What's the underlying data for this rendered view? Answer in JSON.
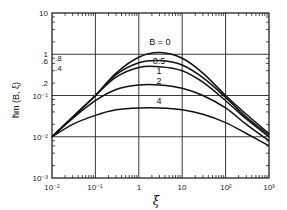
{
  "chart_data": {
    "type": "line",
    "title": "",
    "xlabel": "ξ",
    "ylabel": "h̄m(B,ξ)",
    "xscale": "log",
    "yscale": "log",
    "xlim": [
      0.01,
      1000
    ],
    "ylim": [
      0.001,
      10
    ],
    "grid": true,
    "x_ticks": [
      "10⁻²",
      "10⁻¹",
      "1",
      "10",
      "10²",
      "10³"
    ],
    "y_ticks": [
      "10⁻³",
      "10⁻²",
      "10⁻¹",
      ".2",
      ".4",
      ".6",
      ".8",
      "1",
      "10"
    ],
    "x": [
      0.01,
      0.03,
      0.1,
      0.3,
      1,
      3,
      10,
      30,
      100,
      300,
      1000
    ],
    "series": [
      {
        "name": "B = 0",
        "label": "B = 0",
        "values": [
          0.01,
          0.03,
          0.1,
          0.35,
          0.85,
          1.1,
          0.8,
          0.35,
          0.1,
          0.035,
          0.012
        ]
      },
      {
        "name": "B = 0.5",
        "label": "0.5",
        "values": [
          0.01,
          0.03,
          0.1,
          0.32,
          0.62,
          0.7,
          0.55,
          0.27,
          0.09,
          0.03,
          0.011
        ]
      },
      {
        "name": "B = 1",
        "label": "1",
        "values": [
          0.01,
          0.03,
          0.1,
          0.28,
          0.48,
          0.5,
          0.4,
          0.21,
          0.075,
          0.027,
          0.01
        ]
      },
      {
        "name": "B = 2",
        "label": "2",
        "values": [
          0.01,
          0.028,
          0.075,
          0.14,
          0.18,
          0.18,
          0.15,
          0.1,
          0.05,
          0.02,
          0.008
        ]
      },
      {
        "name": "B = 4",
        "label": "4",
        "values": [
          0.01,
          0.02,
          0.033,
          0.045,
          0.05,
          0.05,
          0.045,
          0.035,
          0.022,
          0.012,
          0.006
        ]
      }
    ],
    "legend": "inline curve labels"
  },
  "labels": {
    "xlabel": "ξ",
    "ylabel": "h̄m (B, ξ)",
    "x_ticks": [
      "10⁻²",
      "10⁻¹",
      "1",
      "10",
      "10²",
      "10³"
    ],
    "y_ticks_major": [
      "10",
      "1",
      "10⁻¹",
      "10⁻²",
      "10⁻³"
    ],
    "y_ticks_minor": [
      ".8",
      ".6",
      ".4",
      ".2"
    ],
    "curve_labels": [
      "B = 0",
      "0.5",
      "1",
      "2",
      "4"
    ]
  }
}
